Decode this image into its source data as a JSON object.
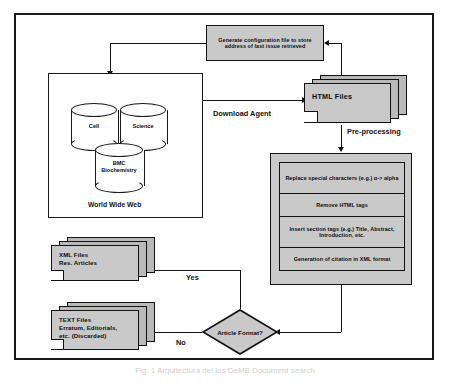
{
  "figure": {
    "caption": "Fig. 1  Arquitectura del los DeMB Document search"
  },
  "nodes": {
    "config_box": {
      "label": "Generate configuration file to store address of last issue retrieved"
    },
    "www_panel": {
      "label": "World Wide Web"
    },
    "db_cell": {
      "label": "Cell"
    },
    "db_science": {
      "label": "Science"
    },
    "db_bmc": {
      "label": "BMC Biochemistry"
    },
    "html_files": {
      "label": "HTML Files"
    },
    "preprocessing": {
      "steps": [
        {
          "label": "Replace special characters (e.g.) α-> alpha"
        },
        {
          "label": "Remove HTML tags"
        },
        {
          "label": "Insert section tags (e.g.) Title, Abstract, Introduction, etc."
        },
        {
          "label": "Generation of citation in XML format"
        }
      ]
    },
    "decision": {
      "label": "Article Format?"
    },
    "xml_files": {
      "line1": "XML Files",
      "line2": "Res. Articles"
    },
    "text_files": {
      "line1": "TEXT Files",
      "line2": "Erratum, Editorials,",
      "line3": "etc. (Discarded)"
    }
  },
  "edge_labels": {
    "download_agent": "Download Agent",
    "preprocessing": "Pre-processing",
    "yes": "Yes",
    "no": "No"
  },
  "colors": {
    "box_fill": "#c9c9c9",
    "shadow_fill": "#b9b9b9",
    "stroke": "#111111",
    "panel_fill": "#ffffff"
  }
}
